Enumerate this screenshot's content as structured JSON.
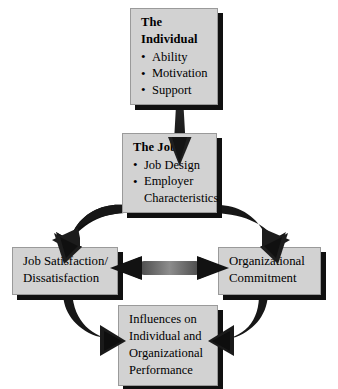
{
  "diagram": {
    "background_color": "#ffffff",
    "box_fill_color": "#d2d2d2",
    "box_shadow_color": "#101010",
    "arrow_color": "#1a1a1a",
    "text_color": "#000000",
    "nodes": [
      {
        "id": "individual",
        "title": "The Individual",
        "items": [
          "Ability",
          "Motivation",
          "Support"
        ]
      },
      {
        "id": "job",
        "title": "The Job",
        "items": [
          "Job Design",
          "Employer"
        ],
        "item_continuations": [
          "",
          "Characteristics"
        ]
      },
      {
        "id": "job_satisfaction",
        "lines": [
          "Job Satisfaction/",
          "Dissatisfaction"
        ]
      },
      {
        "id": "organizational_commitment",
        "lines": [
          "Organizational",
          "Commitment"
        ]
      },
      {
        "id": "influences",
        "lines": [
          "Influences on",
          "Individual and",
          "Organizational",
          "Performance"
        ]
      }
    ],
    "connections": [
      {
        "id": "individual-to-job",
        "from": "individual",
        "to": "job",
        "style": "straight-down",
        "heads": 1
      },
      {
        "id": "job-to-job-satisfaction",
        "from": "job",
        "to": "job_satisfaction",
        "style": "curved-left",
        "heads": 1
      },
      {
        "id": "job-to-organizational-commitment",
        "from": "job",
        "to": "organizational_commitment",
        "style": "curved-right",
        "heads": 1
      },
      {
        "id": "job-satisfaction-commitment-link",
        "from": "job_satisfaction",
        "to": "organizational_commitment",
        "style": "horizontal",
        "heads": 2
      },
      {
        "id": "job-satisfaction-to-influences",
        "from": "job_satisfaction",
        "to": "influences",
        "style": "curved-right-down",
        "heads": 1
      },
      {
        "id": "organizational-commitment-to-influences",
        "from": "organizational_commitment",
        "to": "influences",
        "style": "curved-left-down",
        "heads": 1
      }
    ]
  }
}
